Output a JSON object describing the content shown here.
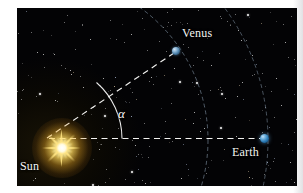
{
  "figure": {
    "type": "astronomy-diagram",
    "background_color": "#010103",
    "page_color": "#ffffff"
  },
  "bodies": [
    {
      "id": "sun",
      "label": "Sun",
      "icon": "sun-starburst-icon",
      "color": "#ffd84a",
      "x": 45,
      "y": 140,
      "label_x": 20,
      "label_y": 160
    },
    {
      "id": "venus",
      "label": "Venus",
      "icon": "planet-dot-icon",
      "color": "#6fa5cc",
      "x": 176,
      "y": 51,
      "label_x": 182,
      "label_y": 27
    },
    {
      "id": "earth",
      "label": "Earth",
      "icon": "planet-dot-icon",
      "color": "#2a79b4",
      "x": 264,
      "y": 138,
      "label_x": 232,
      "label_y": 146
    }
  ],
  "angle": {
    "symbol": "α",
    "name": "elongation-angle",
    "vertex": "sun",
    "between": [
      "sun-venus-line",
      "sun-earth-line"
    ],
    "label_x": 118,
    "label_y": 107
  },
  "lines": [
    {
      "id": "sun-venus-line",
      "from": "sun",
      "to": "venus",
      "style": "dashed",
      "color": "#ffffff"
    },
    {
      "id": "sun-earth-line",
      "from": "sun",
      "to": "earth",
      "style": "dashed",
      "color": "#ffffff"
    }
  ],
  "orbits": [
    {
      "id": "venus-orbit",
      "style": "dashed",
      "color": "#9fb3c6",
      "radius": 163
    },
    {
      "id": "earth-orbit",
      "style": "dashed",
      "color": "#9fb3c6",
      "radius": 223
    }
  ],
  "starfield": {
    "description": "scattered white stars on black sky",
    "star_color": "#ffffff"
  }
}
